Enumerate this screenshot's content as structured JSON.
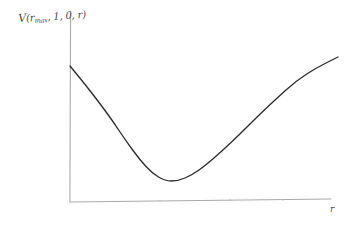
{
  "figure": {
    "background_color": "#ffffff",
    "axis_color": "#a9a9a9",
    "curve_color": "#2b2b2b",
    "y_axis_label_parts": {
      "function_symbol": "V",
      "open_paren": "(",
      "arg1_base": "r",
      "arg1_sub": "max",
      "arg2": ", 1, 0, ",
      "arg3": "r",
      "close_paren": ")"
    },
    "y_axis_label_text": "V(rmax, 1, 0, r)",
    "x_axis_label": "r"
  },
  "chart_data": {
    "type": "line",
    "title": "",
    "subtitle": "",
    "xlabel": "r",
    "ylabel": "V(r_max, 1, 0, r)",
    "style": "hand-drawn sketch",
    "grid": false,
    "legend": null,
    "axis_ticks": {
      "x": [],
      "y": []
    },
    "xlim": [
      0,
      1
    ],
    "ylim": [
      0,
      1
    ],
    "series": [
      {
        "name": "V(r)",
        "points_px": [
          [
            70,
            66
          ],
          [
            84,
            83
          ],
          [
            98,
            101
          ],
          [
            112,
            120
          ],
          [
            126,
            141
          ],
          [
            140,
            160
          ],
          [
            152,
            173
          ],
          [
            165,
            181
          ],
          [
            178,
            181
          ],
          [
            192,
            175
          ],
          [
            206,
            165
          ],
          [
            222,
            151
          ],
          [
            240,
            134
          ],
          [
            258,
            116
          ],
          [
            276,
            99
          ],
          [
            296,
            81
          ],
          [
            316,
            68
          ],
          [
            338,
            57
          ]
        ],
        "x": [
          0.0,
          0.052,
          0.104,
          0.157,
          0.209,
          0.261,
          0.306,
          0.354,
          0.403,
          0.455,
          0.507,
          0.567,
          0.634,
          0.701,
          0.769,
          0.843,
          0.918,
          1.0
        ],
        "y": [
          1.0,
          0.875,
          0.743,
          0.603,
          0.449,
          0.309,
          0.213,
          0.154,
          0.154,
          0.199,
          0.272,
          0.375,
          0.5,
          0.632,
          0.757,
          0.89,
          0.985,
          1.066
        ]
      }
    ],
    "annotations": [
      {
        "label": "minimum",
        "x_px": 165,
        "y_px": 181
      }
    ],
    "axes_geometry_px": {
      "origin": [
        70,
        202
      ],
      "y_axis_top": [
        70,
        11
      ],
      "x_axis_right": [
        330,
        199
      ]
    }
  }
}
